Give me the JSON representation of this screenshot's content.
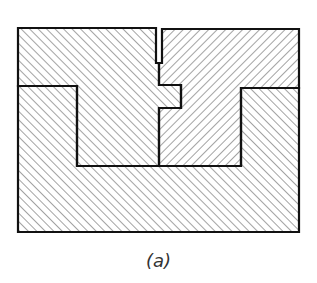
{
  "figure": {
    "caption": "(a)",
    "stroke_color": "#111111",
    "hatch_color": "#555555",
    "parts": [
      {
        "name": "base-block",
        "hatch": "right-leaning"
      },
      {
        "name": "left-upper-block",
        "hatch": "right-leaning"
      },
      {
        "name": "right-upper-block",
        "hatch": "left-leaning"
      }
    ]
  }
}
